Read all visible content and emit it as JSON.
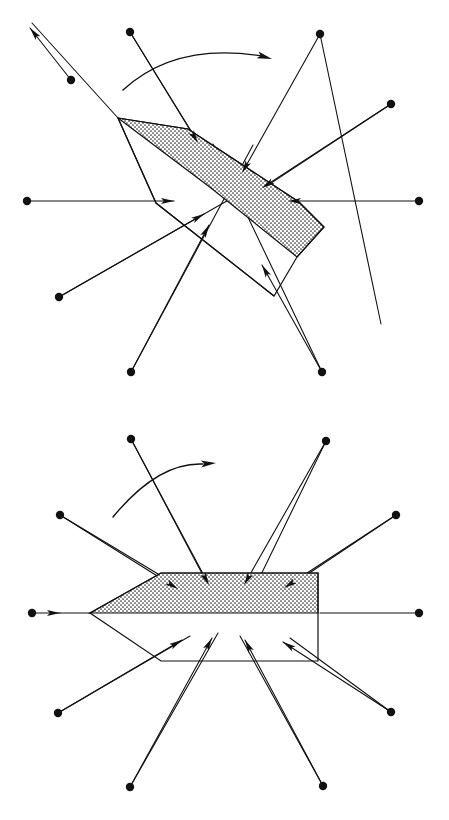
{
  "figure": {
    "panel_count": 2,
    "background_color": "#ffffff",
    "ink_color": "#111111",
    "shade_fill_color": "#d8d8d8",
    "shade_pattern": "dotted-stipple",
    "panels": [
      {
        "id": "panel-top",
        "name": "rotated-pose",
        "label": "",
        "origin": [
          0,
          0
        ],
        "rotation_degrees": -40,
        "hull": {
          "name": "arrow-hull-rotated",
          "apex": [
            118,
            118
          ],
          "outline_points": "118,118 188,129 299,202 324,227 297,257 274,296 156,203 118,118",
          "shaded_points": "118,118 188,129 299,202 324,227 297,257 211,188 118,118",
          "notch_points": "118,118 156,203 274,296"
        },
        "rotation_arc": {
          "name": "rotation-arc-top",
          "path": "M 123 90 Q 175 42 262 56",
          "arrow_tip": [
            272,
            59
          ],
          "arrow_angle_degrees": 16
        },
        "rays": [
          {
            "id": "t-r1",
            "dot": [
              130,
              32
            ],
            "tip": [
              198,
              143
            ],
            "arrow": true,
            "pointing": "inward"
          },
          {
            "id": "t-r2",
            "dot": [
              320,
              34
            ],
            "tip": [
              242,
              173
            ],
            "arrow": true,
            "pointing": "inward"
          },
          {
            "id": "t-r3",
            "dot": [
              71,
              80
            ],
            "tip": [
              30,
              28
            ],
            "arrow": true,
            "pointing": "outward"
          },
          {
            "id": "t-r4",
            "dot": [
              391,
              104
            ],
            "tip": [
              262,
              188
            ],
            "arrow": true,
            "pointing": "inward"
          },
          {
            "id": "t-r5",
            "dot": [
              27,
              201
            ],
            "tip": [
              174,
              201
            ],
            "arrow": true,
            "pointing": "inward"
          },
          {
            "id": "t-r6",
            "dot": [
              419,
              201
            ],
            "tip": [
              288,
              201
            ],
            "arrow": true,
            "pointing": "inward"
          },
          {
            "id": "t-r7",
            "dot": [
              59,
              297
            ],
            "tip": [
              204,
              214
            ],
            "arrow": true,
            "pointing": "inward"
          },
          {
            "id": "t-r8",
            "dot": [
              131,
              372
            ],
            "tip": [
              209,
              225
            ],
            "arrow": true,
            "pointing": "inward"
          },
          {
            "id": "t-r9",
            "dot": [
              322,
              372
            ],
            "tip": [
              262,
              265
            ],
            "arrow": true,
            "pointing": "inward"
          }
        ],
        "pass_through_lines": [
          {
            "id": "t-p1",
            "from": [
              118,
              118
            ],
            "to": [
              32,
              23
            ]
          },
          {
            "id": "t-p2",
            "from": [
              130,
              32
            ],
            "to": [
              238,
              207
            ]
          },
          {
            "id": "t-p3",
            "from": [
              320,
              34
            ],
            "to": [
              381,
              324
            ]
          },
          {
            "id": "t-p4",
            "from": [
              391,
              104
            ],
            "to": [
              235,
              207
            ]
          },
          {
            "id": "t-p5",
            "from": [
              59,
              297
            ],
            "to": [
              246,
              190
            ]
          },
          {
            "id": "t-p6",
            "from": [
              131,
              372
            ],
            "to": [
              253,
              145
            ]
          },
          {
            "id": "t-p7",
            "from": [
              322,
              372
            ],
            "to": [
              213,
              144
            ]
          }
        ]
      },
      {
        "id": "panel-bottom",
        "name": "canonical-pose",
        "label": "",
        "origin": [
          0,
          410
        ],
        "rotation_degrees": 0,
        "hull": {
          "name": "arrow-hull-canonical",
          "apex": [
            90,
            613
          ],
          "outline_points": "90,613 161,573 318,573 318,661 161,661 90,613",
          "shaded_points": "90,613 161,573 318,573 318,613 90,613",
          "axis_y": 613,
          "left_tip_x": 90,
          "right_edge_x": 318,
          "top_y": 573,
          "bottom_y": 661,
          "shoulder_x": 161
        },
        "rotation_arc": {
          "name": "rotation-arc-bottom",
          "path": "M 113 517 Q 158 462 203 464",
          "arrow_tip": [
            216,
            463
          ],
          "arrow_angle_degrees": -4
        },
        "rays": [
          {
            "id": "b-r1",
            "dot": [
              131,
              439
            ],
            "tip": [
              209,
              585
            ],
            "arrow": true,
            "pointing": "inward"
          },
          {
            "id": "b-r2",
            "dot": [
              326,
              441
            ],
            "tip": [
              244,
              585
            ],
            "arrow": true,
            "pointing": "inward"
          },
          {
            "id": "b-r3",
            "dot": [
              60,
              515
            ],
            "tip": [
              178,
              589
            ],
            "arrow": true,
            "pointing": "inward"
          },
          {
            "id": "b-r4",
            "dot": [
              396,
              515
            ],
            "tip": [
              284,
              588
            ],
            "arrow": true,
            "pointing": "inward"
          },
          {
            "id": "b-r5",
            "dot": [
              32,
              613
            ],
            "tip": [
              60,
              613
            ],
            "arrow": true,
            "pointing": "outward"
          },
          {
            "id": "b-r6",
            "dot": [
              419,
              613
            ],
            "tip": [
              320,
              613
            ],
            "arrow": false,
            "pointing": "inward"
          },
          {
            "id": "b-r7",
            "dot": [
              58,
              713
            ],
            "tip": [
              182,
              640
            ],
            "arrow": true,
            "pointing": "inward"
          },
          {
            "id": "b-r8",
            "dot": [
              130,
              787
            ],
            "tip": [
              212,
              638
            ],
            "arrow": true,
            "pointing": "inward"
          },
          {
            "id": "b-r9",
            "dot": [
              323,
              786
            ],
            "tip": [
              245,
              640
            ],
            "arrow": true,
            "pointing": "inward"
          },
          {
            "id": "b-r10",
            "dot": [
              391,
              712
            ],
            "tip": [
              283,
              642
            ],
            "arrow": true,
            "pointing": "inward"
          }
        ],
        "pass_through_lines": [
          {
            "id": "b-p1",
            "from": [
              90,
              613
            ],
            "to": [
              60,
              613
            ]
          },
          {
            "id": "b-p2",
            "from": [
              131,
              439
            ],
            "to": [
              216,
              600
            ]
          },
          {
            "id": "b-p3",
            "from": [
              326,
              441
            ],
            "to": [
              252,
              593
            ]
          },
          {
            "id": "b-p4",
            "from": [
              60,
              515
            ],
            "to": [
              188,
              592
            ]
          },
          {
            "id": "b-p5",
            "from": [
              396,
              515
            ],
            "to": [
              290,
              586
            ]
          },
          {
            "id": "b-p6",
            "from": [
              58,
              713
            ],
            "to": [
              190,
              636
            ]
          },
          {
            "id": "b-p7",
            "from": [
              130,
              787
            ],
            "to": [
              218,
              633
            ]
          },
          {
            "id": "b-p8",
            "from": [
              323,
              786
            ],
            "to": [
              240,
              636
            ]
          },
          {
            "id": "b-p9",
            "from": [
              391,
              712
            ],
            "to": [
              290,
              638
            ]
          }
        ]
      }
    ],
    "dot_radius": 4.2,
    "arrow_head_length": 13,
    "arrow_head_width": 6
  }
}
